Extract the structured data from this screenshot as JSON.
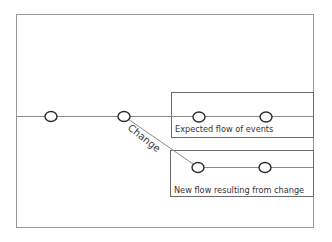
{
  "diagram": {
    "type": "flow-of-events",
    "change_label": "Change",
    "boxes": [
      {
        "id": "expected",
        "label": "Expected flow of events",
        "node_count": 2
      },
      {
        "id": "new",
        "label": "New flow resulting from change",
        "node_count": 2
      }
    ],
    "main_line_nodes": 2,
    "colors": {
      "frame": "#9a9a9a",
      "box": "#6a6a6a",
      "line": "#8c8c8c",
      "node_stroke": "#2a2a2a",
      "text": "#333333"
    }
  }
}
